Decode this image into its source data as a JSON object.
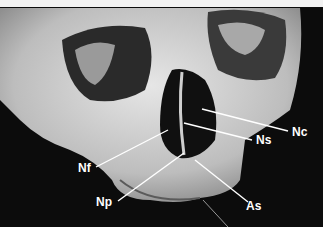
{
  "figure": {
    "labels": [
      {
        "id": "Nc",
        "text": "Nc",
        "x": 292,
        "y": 126
      },
      {
        "id": "Ns",
        "text": "Ns",
        "x": 256,
        "y": 134
      },
      {
        "id": "Nf",
        "text": "Nf",
        "x": 78,
        "y": 162
      },
      {
        "id": "Np",
        "text": "Np",
        "x": 96,
        "y": 196
      },
      {
        "id": "As",
        "text": "As",
        "x": 246,
        "y": 200
      }
    ]
  }
}
